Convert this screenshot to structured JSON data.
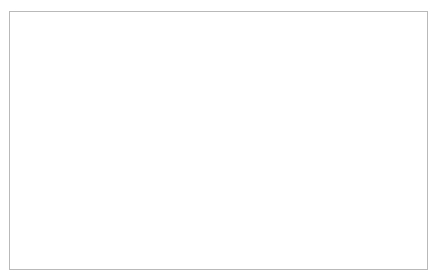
{
  "chart_data": {
    "type": "line",
    "title": "",
    "subtitle": "",
    "xlabel": "",
    "ylabel": "",
    "grid": "horizontal",
    "legend": "none",
    "xlim": [
      1965,
      2013
    ],
    "ylim": [
      0,
      200
    ],
    "ytick_step": 20,
    "xtick_step": 1,
    "xlabel_step": 2,
    "yticks": [
      0,
      20,
      40,
      60,
      80,
      100,
      120,
      140,
      160,
      180,
      200
    ],
    "xticklabels": [
      "1965",
      "1967",
      "1969",
      "1971",
      "1973",
      "1975",
      "1977",
      "1979",
      "1981",
      "1983",
      "1985",
      "1987",
      "1989",
      "1991",
      "1993",
      "1995",
      "1997",
      "1999",
      "2001",
      "2003",
      "2005",
      "2007",
      "2009",
      "2011",
      "2013"
    ],
    "x": [
      1965,
      1966,
      1967,
      1968,
      1969,
      1970,
      1971,
      1972,
      1973,
      1974,
      1975,
      1976,
      1977,
      1978,
      1979,
      1980,
      1981,
      1982,
      1983,
      1984,
      1985,
      1986,
      1987,
      1988,
      1989,
      1990,
      1991,
      1992,
      1993,
      1994,
      1995,
      1996,
      1997,
      1998,
      1999,
      2000,
      2001,
      2002,
      2003,
      2004,
      2005,
      2006,
      2007,
      2008,
      2009,
      2010,
      2011,
      2012,
      2013
    ],
    "series": [
      {
        "name": "Series 1",
        "color": "#1a1a1a",
        "values": [
          2,
          2,
          2,
          2,
          2,
          3,
          3,
          3,
          4,
          5,
          6,
          4,
          3,
          3,
          3,
          4,
          5,
          4,
          4,
          4,
          4,
          4,
          4,
          3,
          3,
          4,
          5,
          4,
          3,
          2,
          2,
          6,
          12,
          20,
          24,
          25,
          29,
          38,
          27,
          40,
          52,
          62,
          72,
          82,
          122,
          108,
          112,
          148,
          187
        ]
      }
    ]
  },
  "axes": {
    "ytitle": "",
    "xtitle": ""
  }
}
